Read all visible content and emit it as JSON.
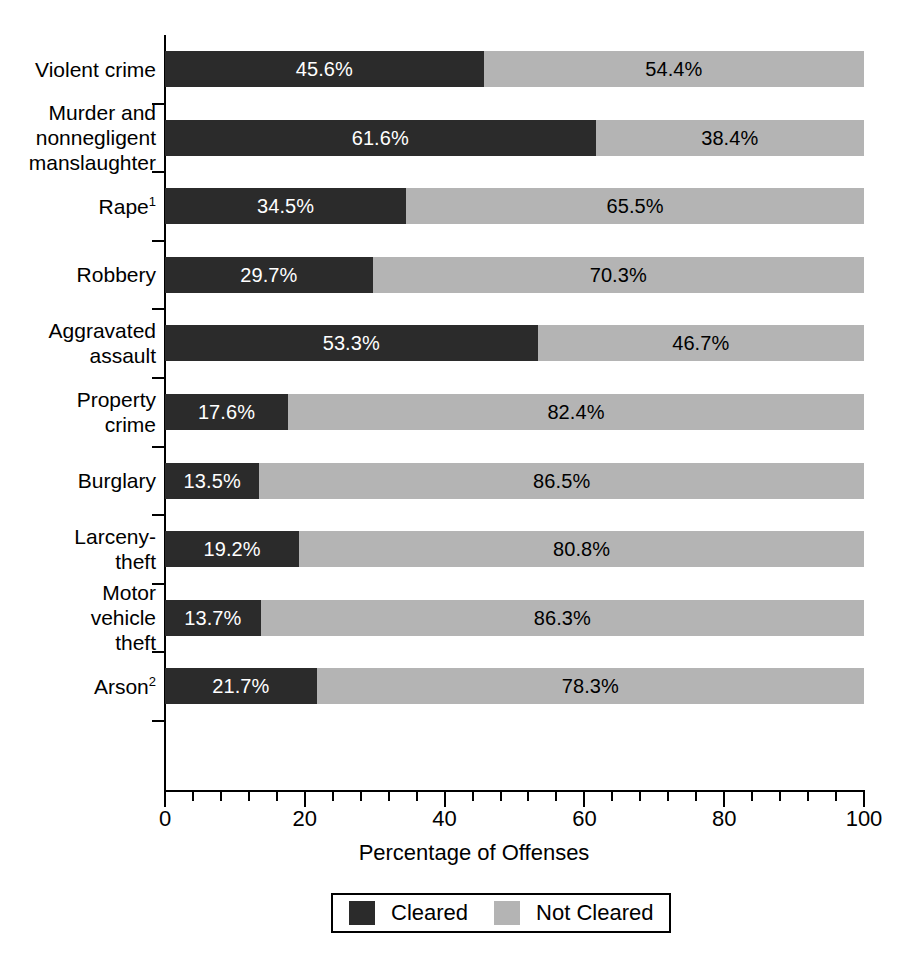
{
  "chart_data": {
    "type": "bar",
    "orientation": "horizontal",
    "stacked": true,
    "title": "",
    "xlabel": "Percentage of Offenses",
    "ylabel": "",
    "xlim": [
      0,
      100
    ],
    "xticks": [
      0,
      20,
      40,
      60,
      80,
      100
    ],
    "xtick_labels": [
      "0",
      "20",
      "40",
      "60",
      "80",
      "100"
    ],
    "minor_tick_step": 4,
    "grid": false,
    "legend_position": "bottom-center",
    "categories": [
      "Violent crime",
      "Murder and nonnegligent manslaughter",
      "Rape",
      "Robbery",
      "Aggravated assault",
      "Property crime",
      "Burglary",
      "Larceny-theft",
      "Motor vehicle theft",
      "Arson"
    ],
    "series": [
      {
        "name": "Cleared",
        "color": "#2b2b2b",
        "values": [
          45.6,
          61.6,
          34.5,
          29.7,
          53.3,
          17.6,
          13.5,
          19.2,
          13.7,
          21.7
        ]
      },
      {
        "name": "Not Cleared",
        "color": "#b4b4b4",
        "values": [
          54.4,
          38.4,
          65.5,
          70.3,
          46.7,
          82.4,
          86.5,
          80.8,
          86.3,
          78.3
        ]
      }
    ]
  },
  "axis": {
    "x_title": "Percentage of Offenses",
    "tick_labels": [
      "0",
      "20",
      "40",
      "60",
      "80",
      "100"
    ]
  },
  "legend": {
    "items": [
      {
        "label": "Cleared",
        "color": "#2b2b2b"
      },
      {
        "label": "Not Cleared",
        "color": "#b4b4b4"
      }
    ]
  },
  "rows": [
    {
      "label_lines": [
        "Violent crime"
      ],
      "footnote": "",
      "cleared": 45.6,
      "not_cleared": 54.4,
      "cleared_label": "45.6%",
      "not_cleared_label": "54.4%"
    },
    {
      "label_lines": [
        "Murder and",
        "nonnegligent",
        "manslaughter"
      ],
      "footnote": "",
      "cleared": 61.6,
      "not_cleared": 38.4,
      "cleared_label": "61.6%",
      "not_cleared_label": "38.4%"
    },
    {
      "label_lines": [
        "Rape"
      ],
      "footnote": "1",
      "cleared": 34.5,
      "not_cleared": 65.5,
      "cleared_label": "34.5%",
      "not_cleared_label": "65.5%"
    },
    {
      "label_lines": [
        "Robbery"
      ],
      "footnote": "",
      "cleared": 29.7,
      "not_cleared": 70.3,
      "cleared_label": "29.7%",
      "not_cleared_label": "70.3%"
    },
    {
      "label_lines": [
        "Aggravated",
        "assault"
      ],
      "footnote": "",
      "cleared": 53.3,
      "not_cleared": 46.7,
      "cleared_label": "53.3%",
      "not_cleared_label": "46.7%"
    },
    {
      "label_lines": [
        "Property",
        "crime"
      ],
      "footnote": "",
      "cleared": 17.6,
      "not_cleared": 82.4,
      "cleared_label": "17.6%",
      "not_cleared_label": "82.4%"
    },
    {
      "label_lines": [
        "Burglary"
      ],
      "footnote": "",
      "cleared": 13.5,
      "not_cleared": 86.5,
      "cleared_label": "13.5%",
      "not_cleared_label": "86.5%"
    },
    {
      "label_lines": [
        "Larceny-",
        "theft"
      ],
      "footnote": "",
      "cleared": 19.2,
      "not_cleared": 80.8,
      "cleared_label": "19.2%",
      "not_cleared_label": "80.8%"
    },
    {
      "label_lines": [
        "Motor",
        "vehicle",
        "theft"
      ],
      "footnote": "",
      "cleared": 13.7,
      "not_cleared": 86.3,
      "cleared_label": "13.7%",
      "not_cleared_label": "86.3%"
    },
    {
      "label_lines": [
        "Arson"
      ],
      "footnote": "2",
      "cleared": 21.7,
      "not_cleared": 78.3,
      "cleared_label": "21.7%",
      "not_cleared_label": "78.3%"
    }
  ]
}
